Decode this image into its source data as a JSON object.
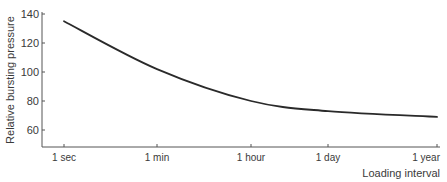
{
  "chart_data": {
    "type": "line",
    "title": "",
    "xlabel": "Loading interval",
    "ylabel": "Relative bursting pressure",
    "x_scale": "log",
    "categories": [
      "1 sec",
      "1 min",
      "1 hour",
      "1 day",
      "1 year"
    ],
    "series": [
      {
        "name": "Relative bursting pressure",
        "values": [
          135,
          102,
          80,
          73,
          69
        ]
      }
    ],
    "y_ticks": [
      60,
      80,
      100,
      120,
      140
    ],
    "ylim": [
      51,
      140
    ],
    "grid": false,
    "legend": "none",
    "colors": {
      "line": "#2a2a2a",
      "axis": "#555555"
    }
  }
}
